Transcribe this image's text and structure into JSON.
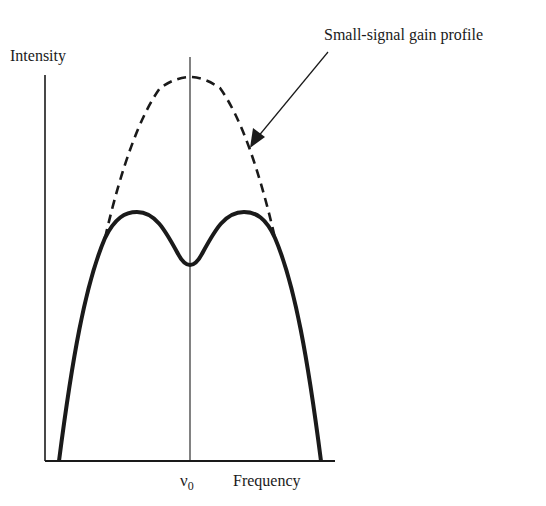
{
  "diagram": {
    "labels": {
      "y_axis": "Intensity",
      "x_axis": "Frequency",
      "center_freq_symbol": "ν",
      "center_freq_subscript": "0",
      "annotation": "Small-signal gain profile"
    },
    "curves": [
      {
        "name": "Small-signal gain profile",
        "style": "dashed",
        "shape": "parabolic, single peak at ν0"
      },
      {
        "name": "Saturated gain (hole-burned) profile",
        "style": "solid-thick",
        "shape": "two peaks with a central dip at ν0"
      }
    ],
    "colors": {
      "ink": "#1a1a1a",
      "background": "#ffffff"
    }
  }
}
